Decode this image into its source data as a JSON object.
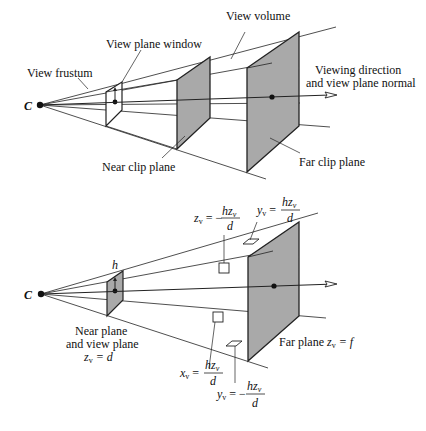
{
  "top_diagram": {
    "center_label": "C",
    "labels": {
      "view_frustum": "View frustum",
      "view_plane_window": "View plane window",
      "view_volume": "View volume",
      "viewing_direction_1": "Viewing direction",
      "viewing_direction_2": "and view plane normal",
      "near_clip_plane": "Near clip plane",
      "far_clip_plane": "Far clip plane"
    }
  },
  "bottom_diagram": {
    "center_label": "C",
    "h_label": "h",
    "labels": {
      "near_plane_1": "Near plane",
      "near_plane_2": "and view plane",
      "near_plane_eq_var": "z",
      "near_plane_eq_sub": "v",
      "near_plane_eq_rest": " = d",
      "far_plane_text": "Far plane ",
      "far_plane_eq_var": "z",
      "far_plane_eq_sub": "v",
      "far_plane_eq_rest": " = f"
    },
    "equations": {
      "zv": {
        "lhs": "z",
        "sub": "v",
        "op": " = −",
        "num": "hz",
        "num_sub": "v",
        "den": "d"
      },
      "yv_top": {
        "lhs": "y",
        "sub": "v",
        "op": " =",
        "num": "hz",
        "num_sub": "v",
        "den": "d"
      },
      "xv": {
        "lhs": "x",
        "sub": "v",
        "op": " =",
        "num": "hz",
        "num_sub": "v",
        "den": "d"
      },
      "yv_bottom": {
        "lhs": "y",
        "sub": "v",
        "op": " = −",
        "num": "hz",
        "num_sub": "v",
        "den": "d"
      }
    }
  },
  "colors": {
    "plane_fill": "#a9a9a9",
    "line": "#222222"
  }
}
